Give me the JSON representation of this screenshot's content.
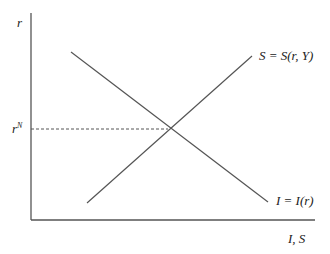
{
  "diagram": {
    "y_axis_label": "r",
    "x_axis_label": "I, S",
    "equilibrium_label": "rN",
    "equilibrium_base": "r",
    "equilibrium_sup": "N",
    "saving_curve_label": "S = S(r, Y)",
    "investment_curve_label": "I = I(r)"
  },
  "colors": {
    "line": "#555555",
    "text": "#222222"
  }
}
